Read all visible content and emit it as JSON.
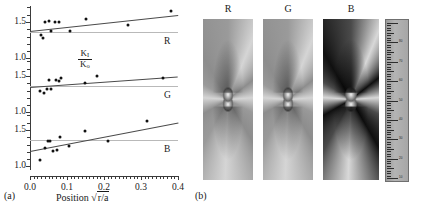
{
  "figure": {
    "panel_a_label": "(a)",
    "panel_b_label": "(b)"
  },
  "chart_data": {
    "type": "scatter",
    "title": "",
    "xlabel": "Position",
    "xlabel_symbol": "r/a",
    "ylabel_numerator": "K",
    "ylabel_numerator_sub": "I",
    "ylabel_denominator": "K",
    "ylabel_denominator_sub": "o",
    "xlim": [
      0.0,
      0.4
    ],
    "ylim": [
      0.95,
      1.72
    ],
    "xticks": [
      0.0,
      0.1,
      0.2,
      0.3,
      0.4
    ],
    "xticklabels": [
      "0.0",
      "0.1",
      "0.2",
      "0.3",
      "0.4"
    ],
    "yticks": [
      1.0,
      1.5
    ],
    "yticklabels": [
      "1.0",
      "1.5"
    ],
    "grid": false,
    "legend": "none",
    "reference_line_value": 1.36,
    "panels": [
      {
        "name": "R",
        "label": "R",
        "fit_y_at_xmin": 1.375,
        "fit_y_at_xmax": 1.595,
        "reference_y": 1.36,
        "points": [
          {
            "x": 0.03,
            "y": 1.325
          },
          {
            "x": 0.035,
            "y": 1.275
          },
          {
            "x": 0.04,
            "y": 1.5
          },
          {
            "x": 0.05,
            "y": 1.52
          },
          {
            "x": 0.058,
            "y": 1.38
          },
          {
            "x": 0.068,
            "y": 1.5
          },
          {
            "x": 0.078,
            "y": 1.495
          },
          {
            "x": 0.108,
            "y": 1.37
          },
          {
            "x": 0.15,
            "y": 1.545
          },
          {
            "x": 0.265,
            "y": 1.455
          },
          {
            "x": 0.38,
            "y": 1.65
          }
        ]
      },
      {
        "name": "G",
        "label": "G",
        "fit_y_at_xmin": 1.355,
        "fit_y_at_xmax": 1.5,
        "reference_y": 1.36,
        "points": [
          {
            "x": 0.028,
            "y": 1.295
          },
          {
            "x": 0.038,
            "y": 1.27
          },
          {
            "x": 0.045,
            "y": 1.32
          },
          {
            "x": 0.05,
            "y": 1.44
          },
          {
            "x": 0.058,
            "y": 1.32
          },
          {
            "x": 0.07,
            "y": 1.44
          },
          {
            "x": 0.078,
            "y": 1.425
          },
          {
            "x": 0.085,
            "y": 1.47
          },
          {
            "x": 0.148,
            "y": 1.41
          },
          {
            "x": 0.18,
            "y": 1.5
          },
          {
            "x": 0.36,
            "y": 1.47
          }
        ]
      },
      {
        "name": "B",
        "label": "B",
        "fit_y_at_xmin": 1.205,
        "fit_y_at_xmax": 1.595,
        "reference_y": 1.36,
        "points": [
          {
            "x": 0.028,
            "y": 1.085
          },
          {
            "x": 0.04,
            "y": 1.25
          },
          {
            "x": 0.048,
            "y": 1.355
          },
          {
            "x": 0.055,
            "y": 1.345
          },
          {
            "x": 0.062,
            "y": 1.215
          },
          {
            "x": 0.072,
            "y": 1.23
          },
          {
            "x": 0.08,
            "y": 1.4
          },
          {
            "x": 0.105,
            "y": 1.285
          },
          {
            "x": 0.148,
            "y": 1.48
          },
          {
            "x": 0.21,
            "y": 1.345
          },
          {
            "x": 0.315,
            "y": 1.62
          }
        ]
      }
    ]
  },
  "images": {
    "captions": [
      "R",
      "G",
      "B"
    ],
    "ruler_numbers": [
      "80",
      "70",
      "60",
      "50",
      "40",
      "30",
      "20",
      "10"
    ]
  },
  "colors": {
    "axis": "#3b3b3b",
    "reference_line": "#b9b9b9",
    "fit_line": "#4a4a4a",
    "marker": "#111111",
    "text": "#1a1a1a"
  }
}
